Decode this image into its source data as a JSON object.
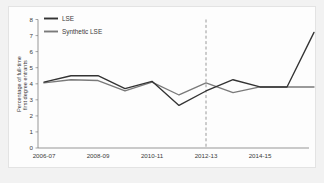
{
  "chart_data": {
    "type": "line",
    "title": "",
    "xlabel": "",
    "ylabel": "Percentage of full-time first degree entrants",
    "ylabel_line1": "Percentage of full-time",
    "ylabel_line2": "first degree entrants",
    "x": [
      "2006-07",
      "2007-08",
      "2008-09",
      "2009-10",
      "2010-11",
      "2011-12",
      "2012-13",
      "2013-14",
      "2014-15",
      "2015-16",
      "2016-17"
    ],
    "categories": [
      "2006-07",
      "2007-08",
      "2008-09",
      "2009-10",
      "2010-11",
      "2011-12",
      "2012-13",
      "2013-14",
      "2014-15",
      "2015-16",
      "2016-17"
    ],
    "xtick_labels": [
      "2006-07",
      "2008-09",
      "2010-11",
      "2012-13",
      "2014-15"
    ],
    "xtick_indices": [
      0,
      2,
      4,
      6,
      8
    ],
    "ytick_labels": [
      "0",
      "1",
      "2",
      "3",
      "4",
      "5",
      "6",
      "7",
      "8"
    ],
    "ylim": [
      0,
      8
    ],
    "grid": false,
    "legend_position": "top-left",
    "series": [
      {
        "name": "LSE",
        "color": "#333333",
        "values": [
          4.1,
          4.5,
          4.5,
          3.7,
          4.15,
          2.65,
          3.55,
          4.25,
          3.8,
          3.8,
          7.2
        ]
      },
      {
        "name": "Synthetic LSE",
        "color": "#7a7a7a",
        "values": [
          4.05,
          4.25,
          4.2,
          3.55,
          4.1,
          3.3,
          4.05,
          3.45,
          3.8,
          3.8,
          3.8
        ]
      }
    ],
    "annotations": [
      {
        "type": "vertical-dashed-line",
        "at": "2012-13",
        "x_index": 6,
        "color": "#9a9a9a",
        "style": "dashed"
      }
    ]
  },
  "legend": {
    "items": [
      {
        "label": "LSE",
        "color": "#333333"
      },
      {
        "label": "Synthetic LSE",
        "color": "#7a7a7a"
      }
    ]
  }
}
